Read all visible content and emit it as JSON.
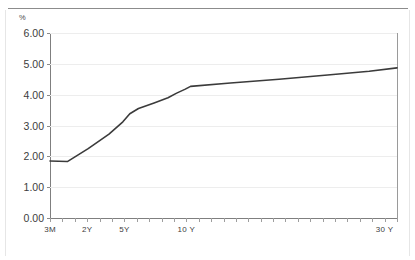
{
  "chart_data": {
    "type": "line",
    "title": "",
    "subtitle": "",
    "xlabel": "",
    "ylabel": "%",
    "unit_label": "%",
    "grid": true,
    "legend": false,
    "legend_position": "none",
    "line_color": "#3b3b3b",
    "grid_color": "#ededed",
    "axis_color": "#7f7f7f",
    "ylim": [
      0.0,
      6.0
    ],
    "ytick_labels": [
      "0.00",
      "1.00",
      "2.00",
      "3.00",
      "4.00",
      "5.00",
      "6.00"
    ],
    "ytick_values": [
      0.0,
      1.0,
      2.0,
      3.0,
      4.0,
      5.0,
      6.0
    ],
    "xtick_labels": [
      "3M",
      "2Y",
      "5Y",
      "10 Y",
      "30 Y"
    ],
    "x_labeled_positions": [
      0,
      3,
      6,
      11,
      27
    ],
    "x_minor_tick_count": 28,
    "categories": [
      "3M",
      "6M",
      "1Y",
      "2Y",
      "3Y",
      "4Y",
      "5Y",
      "6Y",
      "7Y",
      "8Y",
      "9Y",
      "10 Y",
      "12 Y",
      "15 Y",
      "20 Y",
      "25 Y",
      "30 Y"
    ],
    "series": [
      {
        "name": "Yield curve",
        "values": [
          1.85,
          1.83,
          2.25,
          2.72,
          3.12,
          3.38,
          3.55,
          3.73,
          3.9,
          4.05,
          4.18,
          4.27,
          4.38,
          4.5,
          4.64,
          4.76,
          4.87
        ]
      }
    ],
    "points": [
      {
        "x": 0.0,
        "y": 1.85
      },
      {
        "x": 0.05,
        "y": 1.83
      },
      {
        "x": 0.11,
        "y": 2.25
      },
      {
        "x": 0.17,
        "y": 2.72
      },
      {
        "x": 0.21,
        "y": 3.12
      },
      {
        "x": 0.23,
        "y": 3.38
      },
      {
        "x": 0.255,
        "y": 3.55
      },
      {
        "x": 0.3,
        "y": 3.73
      },
      {
        "x": 0.34,
        "y": 3.9
      },
      {
        "x": 0.365,
        "y": 4.05
      },
      {
        "x": 0.39,
        "y": 4.18
      },
      {
        "x": 0.405,
        "y": 4.27
      },
      {
        "x": 0.52,
        "y": 4.38
      },
      {
        "x": 0.66,
        "y": 4.5
      },
      {
        "x": 0.8,
        "y": 4.64
      },
      {
        "x": 0.92,
        "y": 4.76
      },
      {
        "x": 1.0,
        "y": 4.87
      }
    ]
  }
}
